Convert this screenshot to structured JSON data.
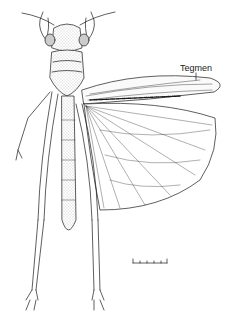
{
  "figure": {
    "labels": [
      {
        "text": "Tegmen",
        "target": "forewing"
      }
    ],
    "scale_bar": {
      "ticks": 6
    }
  },
  "colors": {
    "ink": "#1a1a1a",
    "background": "#ffffff",
    "stipple": "#bdbdbd"
  }
}
